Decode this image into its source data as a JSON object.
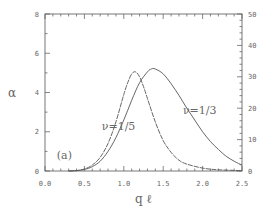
{
  "chart_data": {
    "type": "line",
    "title": "",
    "panel_label": "(a)",
    "xlabel": "q ℓ",
    "ylabel": "α",
    "xlim": [
      0,
      2.5
    ],
    "ylim": [
      0,
      6
    ],
    "y2lim": [
      0,
      50
    ],
    "x_ticks": [
      "0.0",
      "0.5",
      "1.0",
      "1.5",
      "2.0",
      "2.5"
    ],
    "x_tick_values": [
      0,
      0.5,
      1.0,
      1.5,
      2.0,
      2.5
    ],
    "y_ticks": [
      "0",
      "2",
      "4",
      "6"
    ],
    "y_tick_values": [
      0,
      2,
      4,
      6
    ],
    "y2_ticks": [
      "0",
      "10",
      "20",
      "30",
      "40",
      "50"
    ],
    "y2_tick_values": [
      0,
      10,
      20,
      30,
      40,
      50
    ],
    "grid": false,
    "series": [
      {
        "name": "ν=1/5",
        "style": "dashed",
        "x": [
          0.3,
          0.4,
          0.5,
          0.6,
          0.7,
          0.8,
          0.9,
          1.0,
          1.05,
          1.1,
          1.15,
          1.2,
          1.25,
          1.3,
          1.4,
          1.5,
          1.6,
          1.7,
          1.8,
          2.0,
          2.2,
          2.5
        ],
        "y": [
          0.0,
          0.02,
          0.1,
          0.3,
          0.7,
          1.4,
          2.5,
          3.9,
          4.5,
          4.95,
          5.05,
          4.8,
          4.3,
          3.7,
          2.5,
          1.55,
          0.95,
          0.55,
          0.35,
          0.15,
          0.06,
          0.02
        ]
      },
      {
        "name": "ν=1/3",
        "style": "solid",
        "x": [
          0.3,
          0.4,
          0.5,
          0.6,
          0.7,
          0.8,
          0.9,
          1.0,
          1.1,
          1.2,
          1.3,
          1.35,
          1.4,
          1.5,
          1.6,
          1.7,
          1.8,
          1.9,
          2.0,
          2.1,
          2.2,
          2.3,
          2.4,
          2.5
        ],
        "y": [
          0.0,
          0.02,
          0.08,
          0.22,
          0.5,
          1.0,
          1.7,
          2.6,
          3.6,
          4.5,
          5.05,
          5.2,
          5.2,
          4.95,
          4.45,
          3.85,
          3.2,
          2.6,
          2.0,
          1.5,
          1.1,
          0.75,
          0.5,
          0.3
        ]
      }
    ],
    "annotations": [
      {
        "text": "ν=1/5",
        "x": 0.72,
        "y": 2.1
      },
      {
        "text": "ν=1/3",
        "x": 1.75,
        "y": 2.9
      },
      {
        "text": "(a)",
        "x": 0.15,
        "y": 0.6
      }
    ]
  }
}
